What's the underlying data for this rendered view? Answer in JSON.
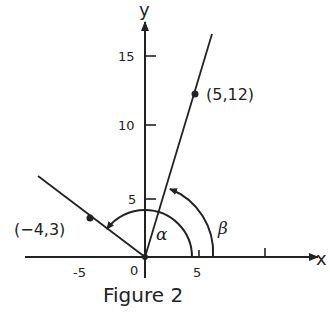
{
  "figure": {
    "caption": "Figure 2",
    "axes": {
      "x_label": "x",
      "y_label": "y",
      "origin_label": "0",
      "x_ticks": [
        "-5",
        "5"
      ],
      "y_ticks": [
        "5",
        "10",
        "15"
      ]
    },
    "points": [
      {
        "label": "(5,12)",
        "x": 5,
        "y": 12
      },
      {
        "label": "(−4,3)",
        "x": -4,
        "y": 3
      }
    ],
    "angles": [
      {
        "symbol": "α",
        "description": "angle from positive x-axis to ray through (-4,3)"
      },
      {
        "symbol": "β",
        "description": "angle from positive x-axis to ray through (5,12)"
      }
    ]
  }
}
